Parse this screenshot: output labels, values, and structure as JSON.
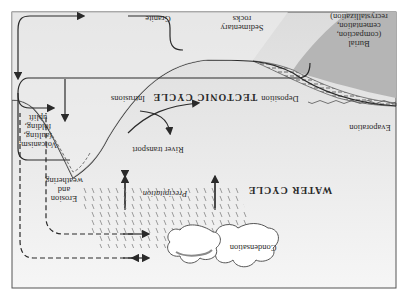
{
  "figure": {
    "orientation": "rotated 180 degrees",
    "colors": {
      "background": "#ffffff",
      "panel_fill": "#e9e9e9",
      "land_fill": "#f4f4f4",
      "sea_fill": "#b5b5b5",
      "line": "#2a2a2a",
      "cloud": "#ffffff",
      "cloud_shadow": "#8a8a8a"
    },
    "titles": {
      "tectonic_cycle": "TECTONIC CYCLE",
      "water_cycle": "WATER CYCLE"
    },
    "labels": {
      "granite": "Granite",
      "sedimentary_rocks_1": "Sedimentary",
      "sedimentary_rocks_2": "rocks",
      "burial_1": "Burial",
      "burial_2": "(compaction,",
      "burial_3": "cementation,",
      "burial_4": "recrystallization)",
      "volcanism_1": "Volcanism,",
      "volcanism_2": "faulting,",
      "volcanism_3": "folding,",
      "volcanism_4": "uplift",
      "intrusions": "Intrusions",
      "deposition": "Deposition",
      "river_transport": "River transport",
      "erosion_1": "Erosion",
      "erosion_2": "and",
      "erosion_3": "weathering",
      "precipitation": "Precipitation",
      "evaporation": "Evaporation",
      "condensation": "Condensation"
    }
  }
}
